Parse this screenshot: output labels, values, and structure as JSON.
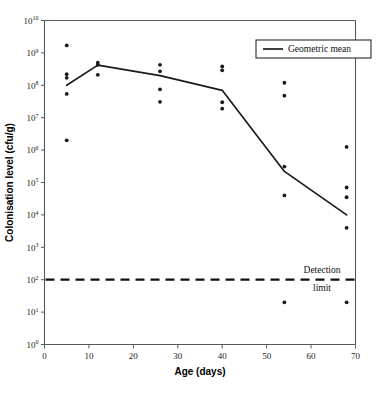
{
  "chart_data": {
    "type": "scatter",
    "title": "",
    "xlabel": "Age (days)",
    "ylabel": "Colonisation level (cfu/g)",
    "xlim": [
      0,
      70
    ],
    "ylim_log10": [
      0,
      10
    ],
    "yscale": "log",
    "grid": false,
    "xticks": [
      0,
      10,
      20,
      30,
      40,
      50,
      60,
      70
    ],
    "xtick_labels": [
      "0",
      "10",
      "20",
      "30",
      "40",
      "50",
      "60",
      "70"
    ],
    "ytick_labels": [
      "10⁰",
      "10¹",
      "10²",
      "10³",
      "10⁴",
      "10⁵",
      "10⁶",
      "10⁷",
      "10⁸",
      "10⁹",
      "10¹⁰"
    ],
    "ytick_mantissa": "10",
    "ytick_exponents": [
      "0",
      "1",
      "2",
      "3",
      "4",
      "5",
      "6",
      "7",
      "8",
      "9",
      "10"
    ],
    "legend": {
      "position": "top-right",
      "entries": [
        {
          "label": "Geometric mean",
          "marker": "line",
          "color": "#1b1b1b"
        }
      ]
    },
    "annotations": [
      {
        "name": "detection-limit",
        "text_line1": "Detection",
        "text_line2": "limit",
        "y_value": 100,
        "style": "dashed-horizontal-line"
      }
    ],
    "series": [
      {
        "name": "Geometric mean",
        "type": "line",
        "x": [
          5,
          12,
          26,
          40,
          54,
          68
        ],
        "y": [
          100000000.0,
          420000000.0,
          200000000.0,
          70000000.0,
          220000.0,
          10000.0
        ]
      },
      {
        "name": "Individual samples",
        "type": "scatter",
        "points": [
          {
            "x": 5,
            "y": 1700000000.0
          },
          {
            "x": 5,
            "y": 220000000.0
          },
          {
            "x": 5,
            "y": 170000000.0
          },
          {
            "x": 5,
            "y": 54000000.0
          },
          {
            "x": 5,
            "y": 2000000.0
          },
          {
            "x": 12,
            "y": 500000000.0
          },
          {
            "x": 12,
            "y": 430000000.0
          },
          {
            "x": 12,
            "y": 210000000.0
          },
          {
            "x": 26,
            "y": 430000000.0
          },
          {
            "x": 26,
            "y": 270000000.0
          },
          {
            "x": 26,
            "y": 75000000.0
          },
          {
            "x": 26,
            "y": 31000000.0
          },
          {
            "x": 40,
            "y": 380000000.0
          },
          {
            "x": 40,
            "y": 290000000.0
          },
          {
            "x": 40,
            "y": 30000000.0
          },
          {
            "x": 40,
            "y": 19000000.0
          },
          {
            "x": 54,
            "y": 120000000.0
          },
          {
            "x": 54,
            "y": 48000000.0
          },
          {
            "x": 54,
            "y": 310000.0
          },
          {
            "x": 54,
            "y": 40000.0
          },
          {
            "x": 54,
            "y": 20.0
          },
          {
            "x": 68,
            "y": 1250000.0
          },
          {
            "x": 68,
            "y": 70000.0
          },
          {
            "x": 68,
            "y": 35000.0
          },
          {
            "x": 68,
            "y": 4000.0
          },
          {
            "x": 68,
            "y": 20.0
          }
        ]
      }
    ]
  }
}
